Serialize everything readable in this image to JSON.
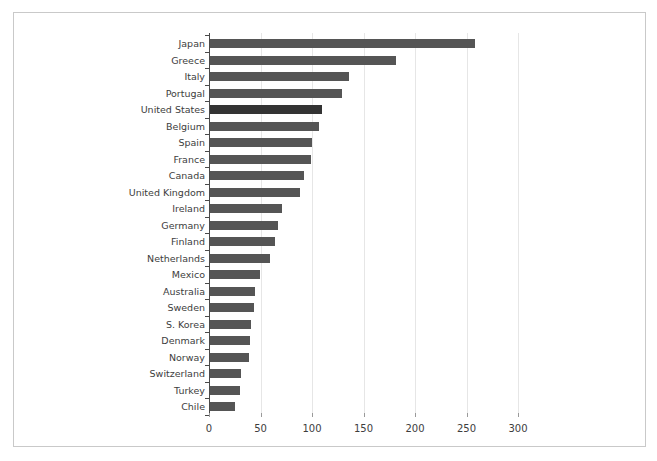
{
  "chart_data": {
    "type": "bar",
    "orientation": "horizontal",
    "title": "",
    "xlabel": "",
    "ylabel": "",
    "xlim": [
      0,
      330
    ],
    "xticks": [
      0,
      50,
      100,
      150,
      200,
      250,
      300
    ],
    "grid": true,
    "legend": "none",
    "highlight_category": "United States",
    "colors": {
      "bar": "#555555",
      "highlight_bar": "#333333",
      "axis": "#4a4a4a",
      "gridline": "#e6e6e6",
      "frame": "#c9c9c9",
      "text": "#3d3d3d",
      "background": "#ffffff"
    },
    "categories": [
      "Japan",
      "Greece",
      "Italy",
      "Portugal",
      "United States",
      "Belgium",
      "Spain",
      "France",
      "Canada",
      "United Kingdom",
      "Ireland",
      "Germany",
      "Finland",
      "Netherlands",
      "Mexico",
      "Australia",
      "Sweden",
      "S. Korea",
      "Denmark",
      "Norway",
      "Switzerland",
      "Turkey",
      "Chile"
    ],
    "values": [
      257,
      181,
      135,
      128,
      109,
      106,
      99,
      98,
      91,
      87,
      70,
      66,
      63,
      58,
      49,
      44,
      43,
      40,
      39,
      38,
      30,
      29,
      24
    ]
  }
}
